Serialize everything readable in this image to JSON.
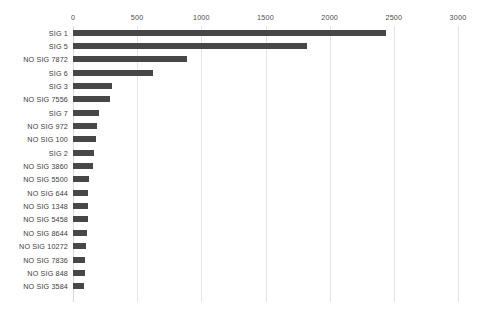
{
  "chart_data": {
    "type": "bar",
    "orientation": "horizontal",
    "title": "",
    "xlabel": "",
    "ylabel": "",
    "xlim": [
      0,
      3000
    ],
    "xticks": [
      0,
      500,
      1000,
      1500,
      2000,
      2500,
      3000
    ],
    "grid": true,
    "legend": false,
    "bar_color": "#474747",
    "gridline_color": "#e4e4e4",
    "background_color": "#ffffff",
    "categories": [
      "SIG 1",
      "SIG 5",
      "NO SIG 7872",
      "SIG 6",
      "SIG 3",
      "NO SIG 7556",
      "SIG 7",
      "NO SIG 972",
      "NO SIG 100",
      "SIG 2",
      "NO SIG 3860",
      "NO SIG 5500",
      "NO SIG 644",
      "NO SIG 1348",
      "NO SIG 5458",
      "NO SIG 8644",
      "NO SIG 10272",
      "NO SIG 7836",
      "NO SIG 848",
      "NO SIG 3584"
    ],
    "values": [
      2440,
      1820,
      890,
      620,
      300,
      290,
      205,
      190,
      180,
      160,
      158,
      128,
      120,
      118,
      115,
      112,
      100,
      95,
      90,
      88
    ]
  }
}
